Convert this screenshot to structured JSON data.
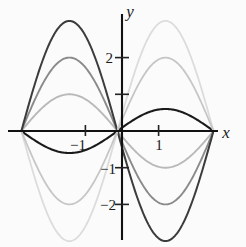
{
  "figure": {
    "background_color": "#fbfbfb",
    "axis_color": "#111111"
  },
  "axes": {
    "x_label": "x",
    "y_label": "y",
    "x_ticks": [
      {
        "value": -1,
        "label": "−1"
      },
      {
        "value": 1,
        "label": "1"
      }
    ],
    "y_ticks": [
      {
        "value": 2,
        "label": "2"
      },
      {
        "value": 1,
        "label": ""
      },
      {
        "value": -1,
        "label": "−1"
      },
      {
        "value": -2,
        "label": "−2"
      }
    ]
  },
  "chart_data": {
    "type": "line",
    "title": "",
    "subtitle": "",
    "xlabel": "x",
    "ylabel": "y",
    "xlim": [
      -2.75,
      3.35
    ],
    "ylim": [
      -3.25,
      3.25
    ],
    "grid": false,
    "legend": "none",
    "x_tick_labels": [
      "−1",
      "1"
    ],
    "x_tick_values": [
      -1,
      1
    ],
    "y_tick_labels": [
      "2",
      "",
      "−1",
      "−2"
    ],
    "y_tick_values": [
      2,
      1,
      -1,
      -2
    ],
    "x_zero_left": -2.75,
    "x_zero_right": 2.5,
    "series": [
      {
        "name": "amplitude-0.6-dark",
        "amplitude": 0.6,
        "sign": -1,
        "color": "#1a1a1a",
        "stroke_width": 2.1,
        "peak_left": -0.6,
        "peak_right": 0.6,
        "values": [
          0,
          -0.42,
          -0.59,
          -0.52,
          -0.25,
          0,
          0.3,
          0.56,
          0.58,
          0.34,
          0
        ]
      },
      {
        "name": "amplitude-1-light",
        "amplitude": 1.0,
        "sign": 1,
        "color": "#b9b9b9",
        "stroke_width": 1.9,
        "peak_left": 1.0,
        "peak_right": -1.0,
        "values": [
          0,
          0.7,
          0.99,
          0.87,
          0.42,
          0,
          -0.5,
          -0.93,
          -0.97,
          -0.57,
          0
        ]
      },
      {
        "name": "amplitude-2-medium",
        "amplitude": 2.0,
        "sign": 1,
        "color": "#8a8a8a",
        "stroke_width": 1.9,
        "peak_left": 2.0,
        "peak_right": -2.0,
        "values": [
          0,
          1.4,
          1.98,
          1.74,
          0.84,
          0,
          -1.0,
          -1.86,
          -1.94,
          -1.14,
          0
        ]
      },
      {
        "name": "amplitude-3-dark",
        "amplitude": 3.0,
        "sign": 1,
        "color": "#3c3c3c",
        "stroke_width": 2.0,
        "peak_left": 3.0,
        "peak_right": -3.0,
        "values": [
          0,
          2.1,
          2.97,
          2.61,
          1.26,
          0,
          -1.5,
          -2.79,
          -2.91,
          -1.71,
          0
        ]
      },
      {
        "name": "amplitude-3-lightest",
        "amplitude": 3.0,
        "sign": -1,
        "color": "#dcdcdc",
        "stroke_width": 1.8,
        "peak_left": -3.0,
        "peak_right": 3.0,
        "values": [
          0,
          -2.1,
          -2.97,
          -2.61,
          -1.26,
          0,
          1.5,
          2.79,
          2.91,
          1.71,
          0
        ]
      },
      {
        "name": "amplitude-2-lighter",
        "amplitude": 2.0,
        "sign": -1,
        "color": "#c6c6c6",
        "stroke_width": 1.8,
        "peak_left": -2.0,
        "peak_right": 2.0,
        "values": [
          0,
          -1.4,
          -1.98,
          -1.74,
          -0.84,
          0,
          1.0,
          1.86,
          1.94,
          1.14,
          0
        ]
      }
    ]
  }
}
